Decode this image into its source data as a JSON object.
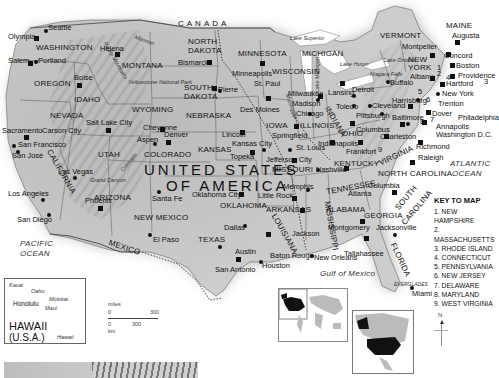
{
  "country_label": [
    "UNITED STATES",
    "OF AMERICA"
  ],
  "neighbors": {
    "canada": "CANADA",
    "mexico": "MEXICO"
  },
  "water_bodies": {
    "pacific": [
      "PACIFIC",
      "OCEAN"
    ],
    "atlantic": [
      "ATLANTIC",
      "OCEAN"
    ],
    "gulf": "Gulf of Mexico",
    "lake_superior": "Lake Superior",
    "lake_huron": "Lake Huron",
    "lake_ontario": "Lake Ontario",
    "lake_michigan": "Lake Michigan",
    "niagara": "Niagara Falls"
  },
  "physical": {
    "rockies": "Rocky Mountains",
    "yellowstone": "Yellowstone National Park",
    "grand_canyon": "Grand Canyon",
    "colorado_river": "Colorado",
    "missouri_river": "Missouri",
    "mississippi_river": "Mississippi",
    "everglades": "EVERGLADES"
  },
  "states": {
    "washington": "WASHINGTON",
    "oregon": "OREGON",
    "idaho": "IDAHO",
    "montana": "MONTANA",
    "wyoming": "WYOMING",
    "nevada": "NEVADA",
    "utah": "UTAH",
    "california": "CALIFORNIA",
    "arizona": "ARIZONA",
    "colorado": "COLORADO",
    "new_mexico": "NEW MEXICO",
    "north_dakota": [
      "NORTH",
      "DAKOTA"
    ],
    "south_dakota": [
      "SOUTH",
      "DAKOTA"
    ],
    "nebraska": "NEBRASKA",
    "kansas": "KANSAS",
    "oklahoma": "OKLAHOMA",
    "texas": "TEXAS",
    "minnesota": "MINNESOTA",
    "iowa": "IOWA",
    "missouri": "MISSOURI",
    "arkansas": "ARKANSAS",
    "louisiana": "LOUISIANA",
    "wisconsin": "WISCONSIN",
    "illinois": "ILLINOIS",
    "michigan": "MICHIGAN",
    "indiana": "INDIANA",
    "ohio": "OHIO",
    "kentucky": "KENTUCKY",
    "tennessee": "TENNESSEE",
    "mississippi": "MISSISSIPPI",
    "alabama": "ALABAMA",
    "georgia": "GEORGIA",
    "florida": "FLORIDA",
    "south_carolina": [
      "SOUTH",
      "CAROLINA"
    ],
    "north_carolina": "NORTH CAROLINA",
    "virginia": "VIRGINIA",
    "new_york": [
      "NEW",
      "YORK"
    ],
    "vermont": "VERMONT",
    "maine": "MAINE"
  },
  "cities": {
    "seattle": "Seattle",
    "olympia": "Olympia",
    "salem": "Salem",
    "portland": "Portland",
    "boise": "Boise",
    "helena": "Helena",
    "cheyenne": "Cheyenne",
    "salt_lake": "Salt Lake City",
    "sacramento": "Sacramento",
    "carson": "Carson City",
    "san_francisco": "San Francisco",
    "san_jose": "San José",
    "las_vegas": "Las Vegas",
    "los_angeles": "Los Angeles",
    "san_diego": "San Diego",
    "phoenix": "Phoenix",
    "aspen": "Aspen",
    "denver": "Denver",
    "santa_fe": "Santa Fe",
    "el_paso": "El Paso",
    "bismarck": "Bismarck",
    "pierre": "Pierre",
    "lincoln": "Lincoln",
    "topeka": "Topeka",
    "kansas_city": "Kansas City",
    "oklahoma_city": "Oklahoma City",
    "dallas": "Dallas",
    "austin": "Austin",
    "san_antonio": "San Antonio",
    "houston": "Houston",
    "minneapolis": "Minneapolis",
    "st_paul": "St. Paul",
    "des_moines": "Des Moines",
    "jefferson": "Jefferson City",
    "st_louis": "St. Louis",
    "little_rock": "Little Rock",
    "memphis": "Memphis",
    "baton_rouge": "Baton Rouge",
    "new_orleans": "New Orleans",
    "jackson": "Jackson",
    "milwaukee": "Milwaukee",
    "madison": "Madison",
    "chicago": "Chicago",
    "springfield": "Springfield",
    "indianapolis": "Indianapolis",
    "lansing": "Lansing",
    "detroit": "Detroit",
    "toledo": "Toledo",
    "cleveland": "Cleveland",
    "columbus": "Columbus",
    "frankfort": "Frankfort",
    "nashville": "Nashville",
    "montgomery": "Montgomery",
    "atlanta": "Atlanta",
    "tallahassee": "Tallahassee",
    "jacksonville": "Jacksonville",
    "miami": "Miami",
    "columbia": "Columbia",
    "raleigh": "Raleigh",
    "richmond": "Richmond",
    "charleston": "Charleston",
    "pittsburgh": "Pittsburgh",
    "harrisburg": "Harrisburg",
    "baltimore": "Baltimore",
    "annapolis": "Annapolis",
    "washington_dc": "Washington D.C.",
    "dover": "Dover",
    "trenton": "Trenton",
    "philadelphia": "Philadelphia",
    "new_york": "New York",
    "buffalo": "Buffalo",
    "albany": "Albany",
    "hartford": "Hartford",
    "providence": "Providence",
    "boston": "Boston",
    "concord": "Concord",
    "montpelier": "Montpelier",
    "augusta": "Augusta"
  },
  "state_numbers": [
    "1",
    "2",
    "3",
    "4",
    "5",
    "6",
    "7",
    "8",
    "9"
  ],
  "key": {
    "title": "KEY TO MAP",
    "items": [
      "1. NEW HAMPSHIRE",
      "2. MASSACHUSETTS",
      "3. RHODE ISLAND",
      "4. CONNECTICUT",
      "5. PENNSYLVANIA",
      "6. NEW JERSEY",
      "7. DELAWARE",
      "8. MARYLAND",
      "9. WEST VIRGINIA"
    ]
  },
  "hawaii": {
    "title": "HAWAII",
    "subtitle": "(U.S.A.)",
    "islands": {
      "kauai": "Kauai",
      "oahu": "Oahu",
      "molokai": "Molokai",
      "maui": "Maui",
      "hawaii": "Hawaii"
    },
    "capital": "Honolulu"
  },
  "scale": {
    "miles_label": "miles",
    "miles_start": "0",
    "miles_end": "300",
    "km_start": "0",
    "km_end": "300",
    "km_label": "km"
  },
  "compass": "N",
  "colors": {
    "land": "#c8c8c8",
    "relief_dark": "#8e8e8e",
    "water": "#ffffff",
    "locator_highlight": "#111111",
    "locator_land": "#bdbdbd"
  }
}
